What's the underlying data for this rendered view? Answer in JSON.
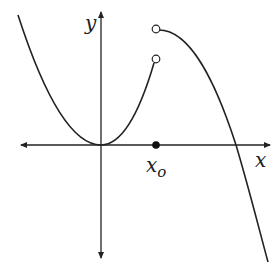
{
  "figure": {
    "type": "piecewise function graph with jump discontinuity",
    "axes": {
      "x_label": "x",
      "y_label": "y",
      "arrows": "both ends on x-axis and y-axis"
    },
    "point_label": "x",
    "point_label_sub": "o",
    "features": [
      "left piece: parabola with vertex at origin, ending in open circle at x_o",
      "right piece: downward-curving arc starting with open circle at x_o (higher), crossing x-axis and descending",
      "filled dot on x-axis at x_o"
    ],
    "colors": {
      "stroke": "#222222",
      "background": "#ffffff"
    }
  }
}
